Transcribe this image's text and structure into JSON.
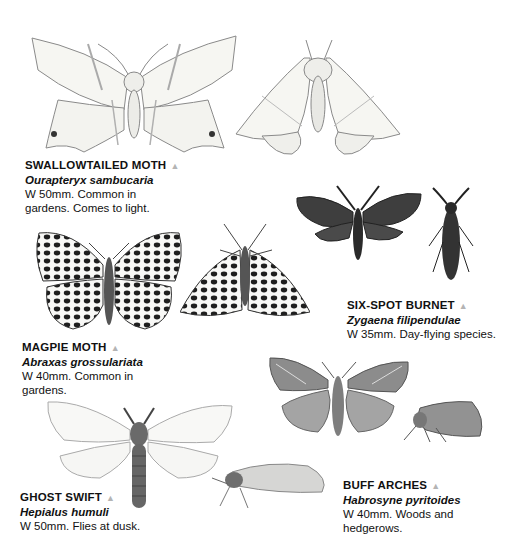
{
  "entries": [
    {
      "id": "swallowtailed",
      "name": "SWALLOWTAILED MOTH",
      "latin": "Ourapteryx sambucaria",
      "desc_line1": "W 50mm. Common in",
      "desc_line2": "gardens. Comes to light.",
      "marker": "▲"
    },
    {
      "id": "six-spot-burnet",
      "name": "SIX-SPOT BURNET",
      "latin": "Zygaena filipendulae",
      "desc_line1": "W 35mm. Day-flying species.",
      "desc_line2": "",
      "marker": "▲"
    },
    {
      "id": "magpie",
      "name": "MAGPIE MOTH",
      "latin": "Abraxas grossulariata",
      "desc_line1": "W 40mm. Common in",
      "desc_line2": "gardens.",
      "marker": "▲"
    },
    {
      "id": "ghost-swift",
      "name": "GHOST SWIFT",
      "latin": "Hepialus humuli",
      "desc_line1": "W 50mm. Flies at dusk.",
      "desc_line2": "",
      "marker": "▲"
    },
    {
      "id": "buff-arches",
      "name": "BUFF ARCHES",
      "latin": "Habrosyne pyritoides",
      "desc_line1": "W 40mm. Woods and",
      "desc_line2": "hedgerows.",
      "marker": "▲"
    }
  ],
  "colors": {
    "background": "#ffffff",
    "text": "#111111",
    "marker": "#b4b4b4",
    "pale_wing": "#f4f4f0",
    "dark_wing": "#3a3a3a",
    "grey_wing": "#9a9a9a"
  }
}
